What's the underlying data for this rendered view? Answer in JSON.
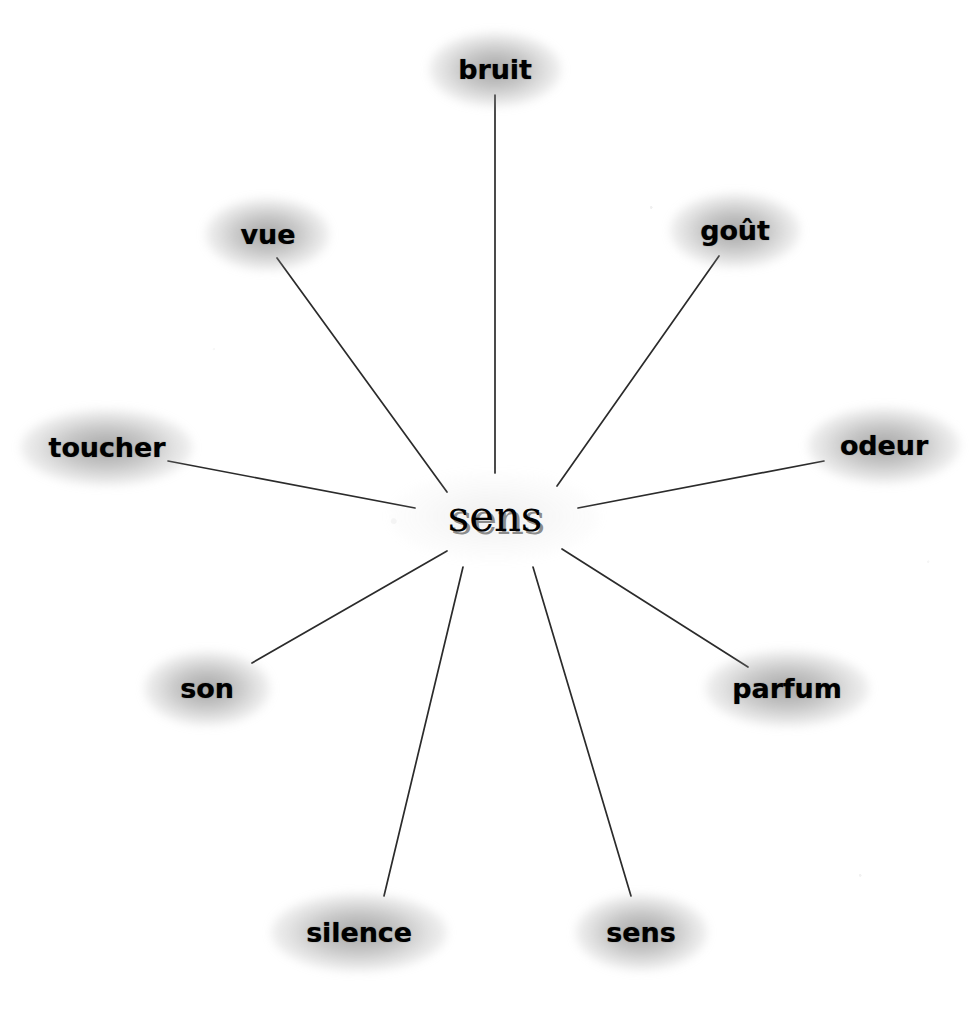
{
  "diagram": {
    "type": "radial-word-association-map",
    "language": "fr",
    "background_color": "#ffffff",
    "line_color": "#2b2b2b",
    "text_color": "#000000",
    "halo_color": "#787878",
    "center": {
      "label": "sens",
      "x": 495,
      "y": 516
    },
    "nodes": [
      {
        "id": "bruit",
        "label": "bruit",
        "x": 495,
        "y": 69,
        "halo_w": 132,
        "halo_h": 74,
        "line": {
          "x1": 495,
          "y1": 95,
          "x2": 495,
          "y2": 473
        }
      },
      {
        "id": "vue",
        "label": "vue",
        "x": 268,
        "y": 234,
        "halo_w": 124,
        "halo_h": 72,
        "line": {
          "x1": 277,
          "y1": 258,
          "x2": 447,
          "y2": 492
        }
      },
      {
        "id": "gout",
        "label": "goût",
        "x": 735,
        "y": 230,
        "halo_w": 130,
        "halo_h": 74,
        "line": {
          "x1": 719,
          "y1": 256,
          "x2": 557,
          "y2": 486
        }
      },
      {
        "id": "toucher",
        "label": "toucher",
        "x": 107,
        "y": 447,
        "halo_w": 172,
        "halo_h": 76,
        "line": {
          "x1": 168,
          "y1": 461,
          "x2": 415,
          "y2": 508
        }
      },
      {
        "id": "odeur",
        "label": "odeur",
        "x": 884,
        "y": 445,
        "halo_w": 152,
        "halo_h": 76,
        "line": {
          "x1": 824,
          "y1": 461,
          "x2": 578,
          "y2": 508
        }
      },
      {
        "id": "son",
        "label": "son",
        "x": 207,
        "y": 688,
        "halo_w": 126,
        "halo_h": 74,
        "line": {
          "x1": 252,
          "y1": 663,
          "x2": 447,
          "y2": 551
        }
      },
      {
        "id": "parfum",
        "label": "parfum",
        "x": 787,
        "y": 688,
        "halo_w": 164,
        "halo_h": 76,
        "line": {
          "x1": 748,
          "y1": 667,
          "x2": 562,
          "y2": 549
        }
      },
      {
        "id": "silence",
        "label": "silence",
        "x": 359,
        "y": 932,
        "halo_w": 176,
        "halo_h": 78,
        "line": {
          "x1": 384,
          "y1": 896,
          "x2": 463,
          "y2": 567
        }
      },
      {
        "id": "sens-leaf",
        "label": "sens",
        "x": 641,
        "y": 932,
        "halo_w": 132,
        "halo_h": 76,
        "line": {
          "x1": 631,
          "y1": 896,
          "x2": 533,
          "y2": 567
        }
      }
    ]
  }
}
